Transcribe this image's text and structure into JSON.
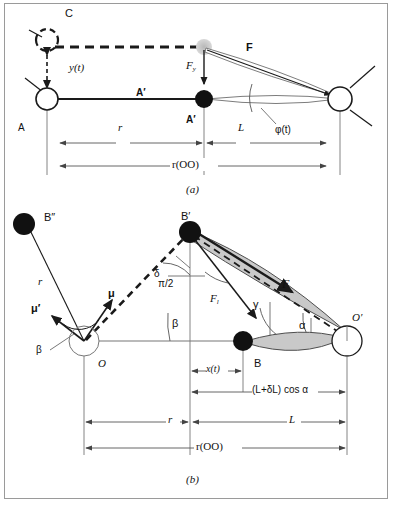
{
  "figure": {
    "caption_a": "(a)",
    "caption_b": "(b)",
    "colors": {
      "line": "#1a1a1a",
      "dimension_line": "#555555",
      "lens_fill": "#c9c9c9",
      "lens_stroke": "#4d4d4d",
      "node_filled": "#111111",
      "node_open_fill": "#ffffff",
      "ghost_node": "#bfbfbf",
      "frame": "#9a9a9a"
    }
  },
  "panel_a": {
    "caption": "(a)",
    "labels": {
      "c": "C",
      "y_of_t": "y(t)",
      "a_left": "A",
      "a_prime_on_rod": "A′",
      "a_prime_bold": "A′",
      "force_f": "F",
      "force_fy": "F",
      "force_fy_sub": "y",
      "phi_of_t": "φ(t)",
      "dim_r": "r",
      "dim_L": "L",
      "dim_roo": "r(OO)"
    },
    "nodes": [
      {
        "name": "pivot-A",
        "type": "open-circle"
      },
      {
        "name": "mass-A-prime",
        "type": "filled-circle"
      },
      {
        "name": "ghost-mass-C",
        "type": "ghost-circle"
      },
      {
        "name": "pivot-O-right",
        "type": "open-circle"
      }
    ]
  },
  "panel_b": {
    "caption": "(b)",
    "labels": {
      "b_double_prime": "B″",
      "b_prime": "B′",
      "b": "B",
      "o": "O",
      "o_prime": "O′",
      "mu": "μ",
      "mu_prime": "μ′",
      "beta_small": "β",
      "beta_large": "β",
      "r_vector": "r",
      "pi_over_2": "π/2",
      "delta": "δ",
      "gamma": "γ",
      "alpha": "α",
      "force_F": "F",
      "force_Fl": "F",
      "force_Fl_sub": "l",
      "dim_x_of_t": "x(t)",
      "dim_projection": "(L+δL) cos α",
      "dim_r": "r",
      "dim_L": "L",
      "dim_roo": "r(OO)"
    },
    "nodes": [
      {
        "name": "mass-B-double-prime",
        "type": "filled-circle"
      },
      {
        "name": "mass-B-prime",
        "type": "filled-circle"
      },
      {
        "name": "mass-B",
        "type": "filled-circle"
      },
      {
        "name": "pivot-O",
        "type": "open-circle"
      },
      {
        "name": "pivot-O-prime",
        "type": "open-circle"
      }
    ]
  }
}
